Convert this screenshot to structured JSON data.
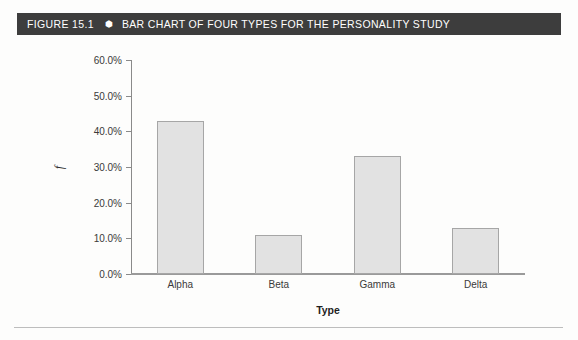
{
  "figure": {
    "number_label": "FIGURE 15.1",
    "bullet_glyph": "⬢",
    "title": "BAR CHART OF FOUR TYPES FOR THE PERSONALITY STUDY",
    "header_bg": "#3d3d3d",
    "header_text_color": "#ffffff"
  },
  "chart_data": {
    "type": "bar",
    "title": "BAR CHART OF FOUR TYPES FOR THE PERSONALITY STUDY",
    "subtitle": "",
    "categories": [
      "Alpha",
      "Beta",
      "Gamma",
      "Delta"
    ],
    "values": [
      43.0,
      11.0,
      33.0,
      13.0
    ],
    "value_labels": [
      "43.0%",
      "11.0%",
      "33.0%",
      "13.0%"
    ],
    "xlabel": "Type",
    "ylabel": "f",
    "ylim": [
      0.0,
      60.0
    ],
    "ytick_values": [
      60.0,
      50.0,
      40.0,
      30.0,
      20.0,
      10.0,
      0.0
    ],
    "ytick_labels": [
      "60.0%",
      "50.0%",
      "40.0%",
      "30.0%",
      "20.0%",
      "10.0%",
      "0.0%"
    ],
    "grid": false,
    "legend": null,
    "bar_fill": "#e2e2e2",
    "bar_stroke": "#a6a6a6",
    "axis_color": "#8a8a8a",
    "text_color": "#3a3a3a"
  }
}
